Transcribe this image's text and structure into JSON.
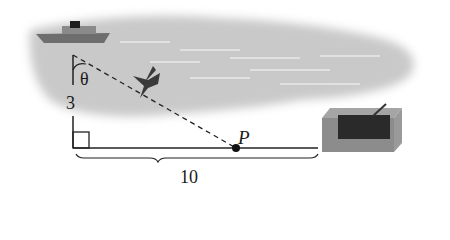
{
  "diagram": {
    "labels": {
      "angle": "θ",
      "vertical_distance": "3",
      "horizontal_distance": "10",
      "point": "P"
    },
    "elements": [
      "ship",
      "bird",
      "water",
      "shore",
      "building",
      "right-angle-marker",
      "dashed-line-of-sight",
      "brace"
    ],
    "colors": {
      "water": "#c8c8c8",
      "line": "#222222",
      "building_dark": "#2a2a2a",
      "building_face": "#8a8a8a"
    }
  }
}
